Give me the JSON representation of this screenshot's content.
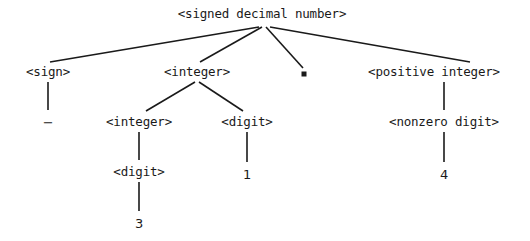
{
  "figure": {
    "name": "parse-tree-signed-decimal-number",
    "background_color": "#ffffff",
    "ink_color": "#1a1a1a",
    "width": 530,
    "height": 241
  },
  "nodes": [
    {
      "id": "root",
      "label": "<signed decimal number>",
      "kind": "nonterminal",
      "x": 262,
      "y": 14
    },
    {
      "id": "sign",
      "label": "<sign>",
      "kind": "nonterminal",
      "x": 48,
      "y": 72
    },
    {
      "id": "integer1",
      "label": "<integer>",
      "kind": "nonterminal",
      "x": 197,
      "y": 72
    },
    {
      "id": "point",
      "label": ".",
      "kind": "terminal-dot",
      "x": 304,
      "y": 74
    },
    {
      "id": "positive-integer",
      "label": "<positive integer>",
      "kind": "nonterminal",
      "x": 434,
      "y": 72
    },
    {
      "id": "minus",
      "label": "−",
      "kind": "terminal",
      "x": 48,
      "y": 122
    },
    {
      "id": "integer2",
      "label": "<integer>",
      "kind": "nonterminal",
      "x": 139,
      "y": 122
    },
    {
      "id": "digit1",
      "label": "<digit>",
      "kind": "nonterminal",
      "x": 247,
      "y": 122
    },
    {
      "id": "nonzero-digit",
      "label": "<nonzero digit>",
      "kind": "nonterminal",
      "x": 444,
      "y": 122
    },
    {
      "id": "digit2",
      "label": "<digit>",
      "kind": "nonterminal",
      "x": 139,
      "y": 172
    },
    {
      "id": "one",
      "label": "1",
      "kind": "terminal",
      "x": 247,
      "y": 174
    },
    {
      "id": "four",
      "label": "4",
      "kind": "terminal",
      "x": 444,
      "y": 174
    },
    {
      "id": "three",
      "label": "3",
      "kind": "terminal",
      "x": 139,
      "y": 223
    }
  ],
  "edges": [
    {
      "id": "root-sign",
      "from": "root",
      "to": "sign",
      "x1": 259,
      "y1": 27,
      "x2": 50,
      "y2": 62
    },
    {
      "id": "root-integer1",
      "from": "root",
      "to": "integer1",
      "x1": 262,
      "y1": 27,
      "x2": 200,
      "y2": 62
    },
    {
      "id": "root-point",
      "from": "root",
      "to": "point",
      "x1": 266,
      "y1": 27,
      "x2": 303,
      "y2": 68
    },
    {
      "id": "root-positive-integer",
      "from": "root",
      "to": "positive-integer",
      "x1": 270,
      "y1": 27,
      "x2": 470,
      "y2": 62
    },
    {
      "id": "sign-minus",
      "from": "sign",
      "to": "minus",
      "x1": 48,
      "y1": 82,
      "x2": 48,
      "y2": 110
    },
    {
      "id": "integer1-integer2",
      "from": "integer1",
      "to": "integer2",
      "x1": 195,
      "y1": 82,
      "x2": 146,
      "y2": 111
    },
    {
      "id": "integer1-digit1",
      "from": "integer1",
      "to": "digit1",
      "x1": 199,
      "y1": 82,
      "x2": 243,
      "y2": 111
    },
    {
      "id": "posint-nonzero",
      "from": "positive-integer",
      "to": "nonzero-digit",
      "x1": 444,
      "y1": 82,
      "x2": 444,
      "y2": 110
    },
    {
      "id": "integer2-digit2",
      "from": "integer2",
      "to": "digit2",
      "x1": 139,
      "y1": 132,
      "x2": 139,
      "y2": 160
    },
    {
      "id": "digit1-one",
      "from": "digit1",
      "to": "one",
      "x1": 247,
      "y1": 132,
      "x2": 247,
      "y2": 162
    },
    {
      "id": "nonzero-four",
      "from": "nonzero-digit",
      "to": "four",
      "x1": 444,
      "y1": 132,
      "x2": 444,
      "y2": 162
    },
    {
      "id": "digit2-three",
      "from": "digit2",
      "to": "three",
      "x1": 139,
      "y1": 182,
      "x2": 139,
      "y2": 211
    }
  ],
  "derivation": {
    "grammar_symbol": "<signed decimal number>",
    "derived_string": "-31.4"
  }
}
